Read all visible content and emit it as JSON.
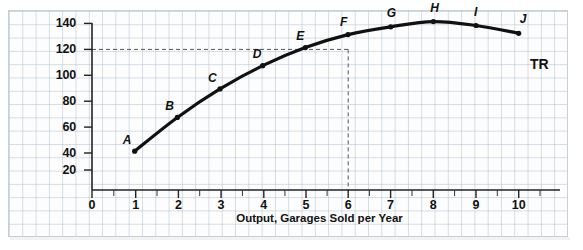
{
  "chart_data": {
    "type": "line",
    "title": "",
    "xlabel": "Output, Garages Sold per Year",
    "ylabel": "Total Revenue per Year (thousands $)",
    "xlim": [
      0,
      10.8
    ],
    "ylim": [
      0,
      148
    ],
    "xticks": [
      0,
      1,
      2,
      3,
      4,
      5,
      6,
      7,
      8,
      9,
      10
    ],
    "yticks": [
      20,
      40,
      60,
      80,
      100,
      120,
      140
    ],
    "grid": true,
    "legend_position": "inline-end-of-curve",
    "series": [
      {
        "name": "TR",
        "x": [
          1,
          2,
          3,
          4,
          5,
          6,
          7,
          8,
          9,
          10
        ],
        "values": [
          30,
          56,
          78,
          96,
          110,
          120,
          126,
          130,
          127,
          121
        ],
        "point_labels": [
          "A",
          "B",
          "C",
          "D",
          "E",
          "F",
          "G",
          "H",
          "I",
          "J"
        ],
        "color": "#111111"
      }
    ],
    "annotations": [
      {
        "name": "curve-label",
        "text": "TR",
        "x": 10,
        "y": 110
      },
      {
        "name": "guide-horizontal",
        "text": "",
        "y": 120
      },
      {
        "name": "guide-vertical",
        "text": "",
        "x": 6
      }
    ]
  },
  "axis": {
    "y_ticks": [
      "140",
      "120",
      "100",
      "80",
      "60",
      "40",
      "20"
    ],
    "x_ticks": [
      "0",
      "1",
      "2",
      "3",
      "4",
      "5",
      "6",
      "7",
      "8",
      "9",
      "10"
    ],
    "y_title": "Total Revenue per Year (thousands $)",
    "x_title": "Output, Garages Sold per Year"
  },
  "points": [
    {
      "label": "A",
      "x": 1,
      "y": 30
    },
    {
      "label": "B",
      "x": 2,
      "y": 56
    },
    {
      "label": "C",
      "x": 3,
      "y": 78
    },
    {
      "label": "D",
      "x": 4,
      "y": 96
    },
    {
      "label": "E",
      "x": 5,
      "y": 110
    },
    {
      "label": "F",
      "x": 6,
      "y": 120
    },
    {
      "label": "G",
      "x": 7,
      "y": 126
    },
    {
      "label": "H",
      "x": 8,
      "y": 130
    },
    {
      "label": "I",
      "x": 9,
      "y": 127
    },
    {
      "label": "J",
      "x": 10,
      "y": 121
    }
  ],
  "curve_label": "TR",
  "colors": {
    "curve": "#111111",
    "axis": "#222222",
    "grid": "#b0c0d0",
    "guide": "#555555",
    "paper": "#fdfdfd"
  }
}
